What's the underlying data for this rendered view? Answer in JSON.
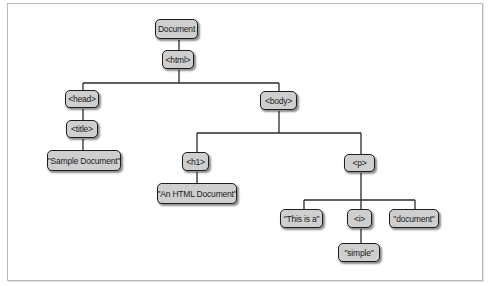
{
  "diagram": {
    "type": "tree",
    "title": "",
    "nodes": [
      {
        "id": "document",
        "label": "Document",
        "x": 155,
        "y": 19,
        "w": 43,
        "h": 20
      },
      {
        "id": "html",
        "label": "<html>",
        "x": 162,
        "y": 50,
        "w": 32,
        "h": 19
      },
      {
        "id": "head",
        "label": "<head>",
        "x": 65,
        "y": 90,
        "w": 34,
        "h": 18
      },
      {
        "id": "body",
        "label": "<body>",
        "x": 260,
        "y": 91,
        "w": 37,
        "h": 19
      },
      {
        "id": "title",
        "label": "<title>",
        "x": 66,
        "y": 120,
        "w": 32,
        "h": 18
      },
      {
        "id": "sample-document",
        "label": "\"Sample Document\"",
        "x": 47,
        "y": 150,
        "w": 74,
        "h": 21
      },
      {
        "id": "h1",
        "label": "<h1>",
        "x": 182,
        "y": 152,
        "w": 27,
        "h": 19
      },
      {
        "id": "p",
        "label": "<p>",
        "x": 344,
        "y": 154,
        "w": 31,
        "h": 18
      },
      {
        "id": "an-html-document",
        "label": "\"An HTML Document\"",
        "x": 157,
        "y": 183,
        "w": 80,
        "h": 21
      },
      {
        "id": "this-is-a",
        "label": "\"This is a\"",
        "x": 280,
        "y": 209,
        "w": 43,
        "h": 19
      },
      {
        "id": "i",
        "label": "<i>",
        "x": 347,
        "y": 209,
        "w": 25,
        "h": 19
      },
      {
        "id": "document-text",
        "label": "\"document\"",
        "x": 389,
        "y": 209,
        "w": 50,
        "h": 19
      },
      {
        "id": "simple",
        "label": "\"simple\"",
        "x": 338,
        "y": 243,
        "w": 42,
        "h": 19
      }
    ],
    "edges": [
      {
        "from": "document",
        "to": "html"
      },
      {
        "from": "html",
        "to": "head"
      },
      {
        "from": "html",
        "to": "body"
      },
      {
        "from": "head",
        "to": "title"
      },
      {
        "from": "title",
        "to": "sample-document"
      },
      {
        "from": "body",
        "to": "h1"
      },
      {
        "from": "body",
        "to": "p"
      },
      {
        "from": "h1",
        "to": "an-html-document"
      },
      {
        "from": "p",
        "to": "this-is-a"
      },
      {
        "from": "p",
        "to": "i"
      },
      {
        "from": "p",
        "to": "document-text"
      },
      {
        "from": "i",
        "to": "simple"
      }
    ],
    "colors": {
      "node_fill": "#cfcfcf",
      "node_border": "#1e1e1e",
      "edge": "#2a2a2a",
      "frame": "#b8b8b8"
    }
  }
}
